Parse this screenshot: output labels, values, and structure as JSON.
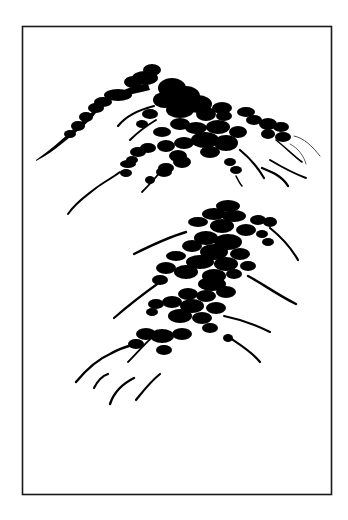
{
  "artwork": {
    "title": "Ink brush mountain study",
    "description": "Two stylized ink-brush mountain peaks made of dense black dots and tapering ridge strokes inside a thin rectangular frame",
    "ink_color": "#000000",
    "paper_color": "#ffffff",
    "frame_color": "#1a1a1a",
    "elements": [
      {
        "name": "upper-mountain",
        "label": "Upper mountain peak"
      },
      {
        "name": "lower-mountain",
        "label": "Lower mountain peak"
      },
      {
        "name": "grass-strokes",
        "label": "Grass strokes at base"
      }
    ]
  }
}
